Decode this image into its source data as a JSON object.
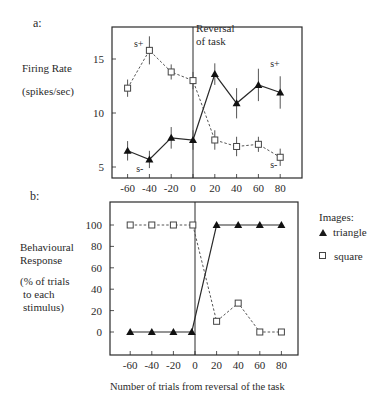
{
  "chart_data": [
    {
      "type": "line",
      "panel_label": "a:",
      "ylabel_lines": [
        "Firing Rate",
        "(spikes/sec)"
      ],
      "xlabel": "Number of trials from reversal of the task",
      "x": [
        -60,
        -40,
        -20,
        0,
        20,
        40,
        60,
        80
      ],
      "xticks": [
        -60,
        -40,
        -20,
        0,
        20,
        40,
        60,
        80
      ],
      "yticks": [
        5,
        10,
        15
      ],
      "ylim": [
        3.6,
        18.9
      ],
      "xlim": [
        -74,
        88
      ],
      "grid": false,
      "annotations": [
        {
          "text": "Reversal",
          "x": 1,
          "y": 17.5
        },
        {
          "text": "of task",
          "x": 1,
          "y": 16.3
        },
        {
          "text": "s+",
          "x": -56,
          "y": 16.1
        },
        {
          "text": "s-",
          "x": -54,
          "y": 4.5
        },
        {
          "text": "s+",
          "x": 69,
          "y": 14.3
        },
        {
          "text": "s-",
          "x": 69,
          "y": 4.9
        }
      ],
      "vertical_line_x": 0,
      "series": [
        {
          "name": "square",
          "marker": "open-square",
          "line": "dashed",
          "values": [
            12.3,
            15.8,
            13.8,
            13.0,
            7.5,
            6.9,
            7.1,
            5.9
          ],
          "errors": [
            0.8,
            1.3,
            0.7,
            0.8,
            0.9,
            0.9,
            0.7,
            0.8
          ]
        },
        {
          "name": "triangle",
          "marker": "filled-triangle",
          "line": "solid",
          "values": [
            6.5,
            5.7,
            7.7,
            7.5,
            13.6,
            10.9,
            12.6,
            11.9
          ],
          "errors": [
            0.9,
            0.8,
            1.0,
            0.9,
            1.0,
            1.4,
            1.5,
            1.5
          ]
        }
      ]
    },
    {
      "type": "line",
      "panel_label": "b:",
      "ylabel_lines": [
        "Behavioural",
        "Response",
        "",
        "(% of trials",
        " to each",
        " stimulus)"
      ],
      "xlabel": "Number of trials from reversal of the task",
      "x": [
        -60,
        -40,
        -20,
        0,
        20,
        40,
        60,
        80
      ],
      "xticks": [
        -60,
        -40,
        -20,
        0,
        20,
        40,
        60,
        80
      ],
      "yticks": [
        0,
        20,
        40,
        60,
        80,
        100
      ],
      "ylim": [
        -20,
        121
      ],
      "xlim": [
        -74,
        88
      ],
      "grid": false,
      "vertical_line_x": 0,
      "series": [
        {
          "name": "square",
          "marker": "open-square",
          "line": "dashed",
          "x": [
            -60,
            -40,
            -20,
            -2,
            20,
            40,
            60,
            80
          ],
          "values": [
            100,
            100,
            100,
            100,
            10,
            27,
            0,
            0
          ]
        },
        {
          "name": "triangle",
          "marker": "filled-triangle",
          "line": "solid",
          "x": [
            -60,
            -40,
            -20,
            -3,
            20,
            40,
            60,
            80
          ],
          "values": [
            0,
            0,
            0,
            0,
            100,
            100,
            100,
            100
          ]
        }
      ],
      "legend": {
        "title": "Images:",
        "entries": [
          "triangle",
          "square"
        ],
        "position": "right"
      }
    }
  ],
  "labels": {
    "panel_a": "a:",
    "panel_b": "b:",
    "a_ylabel_1": "Firing Rate",
    "a_ylabel_2": "(spikes/sec)",
    "b_ylabel_1": "Behavioural",
    "b_ylabel_2": "Response",
    "b_ylabel_3": "(% of trials",
    "b_ylabel_4": "to each",
    "b_ylabel_5": "stimulus)",
    "legend_title": "Images:",
    "legend_triangle": "triangle",
    "legend_square": "square",
    "footer": "Number of trials from reversal of the task"
  },
  "colors": {
    "ink": "#2a2a2a",
    "background": "#ffffff"
  }
}
